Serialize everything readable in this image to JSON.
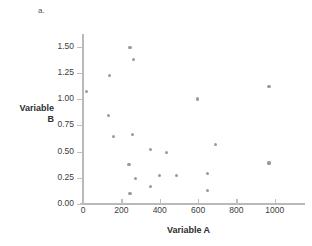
{
  "panel": {
    "letter": "a."
  },
  "chart_data": {
    "type": "scatter",
    "title": "",
    "xlabel": "Variable A",
    "ylabel": "Variable B",
    "xlim": [
      0,
      1100
    ],
    "ylim": [
      0.0,
      1.6
    ],
    "grid": false,
    "legend": null,
    "marker_color": "#9a9a9a",
    "axis_color": "#b9b9b9",
    "xticks": [
      0,
      200,
      400,
      600,
      800,
      1000
    ],
    "xtick_labels": [
      "0",
      "200",
      "400",
      "600",
      "800",
      "1000"
    ],
    "yticks": [
      0.0,
      0.25,
      0.5,
      0.75,
      1.0,
      1.25,
      1.5
    ],
    "ytick_labels": [
      "0.00",
      "0.25",
      "0.50",
      "0.75",
      "1.00",
      "1.25",
      "1.50"
    ],
    "points": [
      {
        "x": 20,
        "y": 1.07
      },
      {
        "x": 135,
        "y": 0.84
      },
      {
        "x": 140,
        "y": 1.22
      },
      {
        "x": 160,
        "y": 0.64
      },
      {
        "x": 245,
        "y": 1.49
      },
      {
        "x": 240,
        "y": 0.38
      },
      {
        "x": 245,
        "y": 0.1
      },
      {
        "x": 262,
        "y": 1.38
      },
      {
        "x": 258,
        "y": 0.66
      },
      {
        "x": 272,
        "y": 0.24
      },
      {
        "x": 350,
        "y": 0.52
      },
      {
        "x": 352,
        "y": 0.17
      },
      {
        "x": 400,
        "y": 0.27
      },
      {
        "x": 435,
        "y": 0.49
      },
      {
        "x": 487,
        "y": 0.27
      },
      {
        "x": 595,
        "y": 1.0
      },
      {
        "x": 648,
        "y": 0.29
      },
      {
        "x": 650,
        "y": 0.13
      },
      {
        "x": 690,
        "y": 0.57
      },
      {
        "x": 970,
        "y": 1.12
      },
      {
        "x": 970,
        "y": 0.39
      }
    ]
  }
}
